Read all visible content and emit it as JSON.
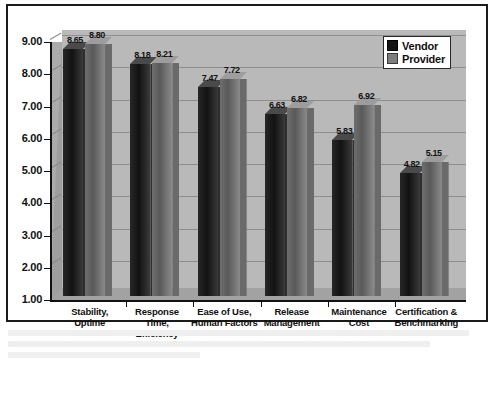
{
  "chart_data": {
    "type": "bar",
    "title": "",
    "xlabel": "",
    "ylabel": "",
    "ylim": [
      1.0,
      9.0
    ],
    "ytick_step": 1.0,
    "grid": true,
    "legend_position": "top-right",
    "style": "3d-clustered-column-grayscale",
    "categories": [
      "Stability, Uptime",
      "Response Time, Efficiency",
      "Ease of Use, Human Factors",
      "Release Management",
      "Maintenance Cost",
      "Certification & Benchmarking"
    ],
    "category_lines": [
      [
        "Stability,",
        "Uptime"
      ],
      [
        "Response",
        "Time,",
        "Efficiency"
      ],
      [
        "Ease of Use,",
        "Human Factors"
      ],
      [
        "Release",
        "Management"
      ],
      [
        "Maintenance",
        "Cost"
      ],
      [
        "Certification &",
        "Benchmarking"
      ]
    ],
    "ytick_labels": [
      "9.00",
      "8.00",
      "7.00",
      "6.00",
      "5.00",
      "4.00",
      "3.00",
      "2.00",
      "1.00"
    ],
    "series": [
      {
        "name": "Vendor",
        "color": "#141414",
        "values": [
          8.65,
          8.18,
          7.47,
          6.63,
          5.83,
          4.82
        ],
        "labels": [
          "8.65",
          "8.18",
          "7.47",
          "6.63",
          "5.83",
          "4.82"
        ]
      },
      {
        "name": "Provider",
        "color": "#7e7e7e",
        "values": [
          8.8,
          8.21,
          7.72,
          6.82,
          6.92,
          5.15
        ],
        "labels": [
          "8.80",
          "8.21",
          "7.72",
          "6.82",
          "6.92",
          "5.15"
        ]
      }
    ]
  },
  "legend": {
    "entries": [
      {
        "label": "Vendor"
      },
      {
        "label": "Provider"
      }
    ]
  }
}
